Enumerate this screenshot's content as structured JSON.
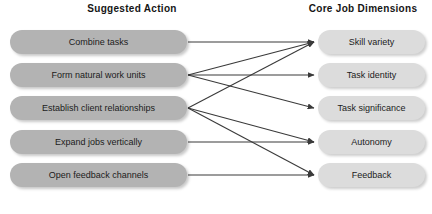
{
  "headers": {
    "left": "Suggested Action",
    "right": "Core Job Dimensions"
  },
  "colors": {
    "left_box_fill": "#b3b3b3",
    "right_box_fill": "#dcdcdc",
    "text": "#1b1b1b",
    "arrow": "#3a3a3a",
    "background": "#ffffff"
  },
  "suggested_actions": [
    {
      "id": "combine-tasks",
      "label": "Combine tasks",
      "y": 42
    },
    {
      "id": "form-natural-units",
      "label": "Form natural work units",
      "y": 75
    },
    {
      "id": "establish-client",
      "label": "Establish client relationships",
      "y": 108
    },
    {
      "id": "expand-jobs",
      "label": "Expand jobs vertically",
      "y": 142
    },
    {
      "id": "open-feedback",
      "label": "Open feedback channels",
      "y": 175
    }
  ],
  "core_job_dimensions": [
    {
      "id": "skill-variety",
      "label": "Skill variety",
      "y": 42
    },
    {
      "id": "task-identity",
      "label": "Task identity",
      "y": 75
    },
    {
      "id": "task-significance",
      "label": "Task significance",
      "y": 108
    },
    {
      "id": "autonomy",
      "label": "Autonomy",
      "y": 142
    },
    {
      "id": "feedback",
      "label": "Feedback",
      "y": 175
    }
  ],
  "connections": [
    {
      "from": "combine-tasks",
      "to": "skill-variety"
    },
    {
      "from": "form-natural-units",
      "to": "skill-variety"
    },
    {
      "from": "form-natural-units",
      "to": "task-identity"
    },
    {
      "from": "form-natural-units",
      "to": "task-significance"
    },
    {
      "from": "establish-client",
      "to": "skill-variety"
    },
    {
      "from": "establish-client",
      "to": "autonomy"
    },
    {
      "from": "establish-client",
      "to": "feedback"
    },
    {
      "from": "expand-jobs",
      "to": "autonomy"
    },
    {
      "from": "open-feedback",
      "to": "feedback"
    }
  ],
  "geometry": {
    "left_box_x": 10,
    "left_box_w": 177,
    "right_box_x": 318,
    "right_box_w": 107,
    "box_h": 24,
    "arrow_start_x": 188,
    "arrow_end_x": 314
  }
}
